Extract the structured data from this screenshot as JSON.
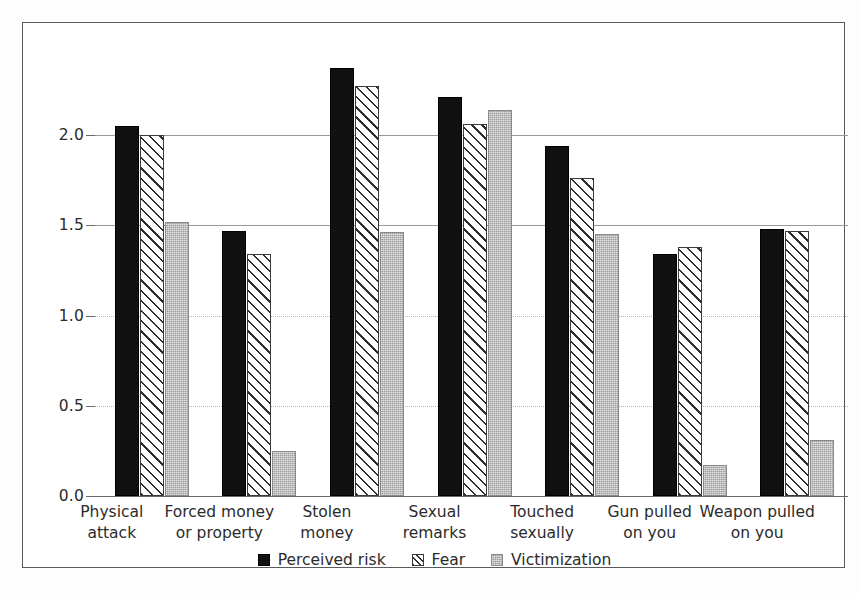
{
  "chart_data": {
    "type": "bar",
    "title": "",
    "subtitle": "",
    "xlabel": "",
    "ylabel": "",
    "ylim": [
      0.0,
      2.5
    ],
    "yticks": [
      0.0,
      0.5,
      1.0,
      1.5,
      2.0
    ],
    "ytick_labels": [
      "0.0",
      "0.5",
      "1.0",
      "1.5",
      "2.0"
    ],
    "grid": true,
    "legend_position": "bottom-center",
    "categories": [
      "Physical attack",
      "Forced money or property",
      "Stolen money",
      "Sexual remarks",
      "Touched sexually",
      "Gun pulled on you",
      "Weapon pulled on you"
    ],
    "category_lines": [
      [
        "Physical",
        "attack"
      ],
      [
        "Forced money",
        "or property"
      ],
      [
        "Stolen",
        "money"
      ],
      [
        "Sexual",
        "remarks"
      ],
      [
        "Touched",
        "sexually"
      ],
      [
        "Gun pulled",
        "on you"
      ],
      [
        "Weapon pulled",
        "on you"
      ]
    ],
    "series": [
      {
        "name": "Perceived risk",
        "fill": "solid-black",
        "color": "#111111",
        "values": [
          2.05,
          1.47,
          2.37,
          2.21,
          1.94,
          1.34,
          1.48
        ]
      },
      {
        "name": "Fear",
        "fill": "diagonal-hatch",
        "color": "#ffffff",
        "values": [
          2.0,
          1.34,
          2.27,
          2.06,
          1.76,
          1.38,
          1.47
        ]
      },
      {
        "name": "Victimization",
        "fill": "stippled-grey",
        "color": "#9d9d9d",
        "values": [
          1.52,
          0.25,
          1.46,
          2.14,
          1.45,
          0.17,
          0.31
        ]
      }
    ]
  },
  "legend": {
    "items": [
      {
        "label": "Perceived risk"
      },
      {
        "label": "Fear"
      },
      {
        "label": "Victimization"
      }
    ]
  },
  "axis": {
    "y_tick_labels": [
      "0.0",
      "0.5",
      "1.0",
      "1.5",
      "2.0"
    ]
  }
}
